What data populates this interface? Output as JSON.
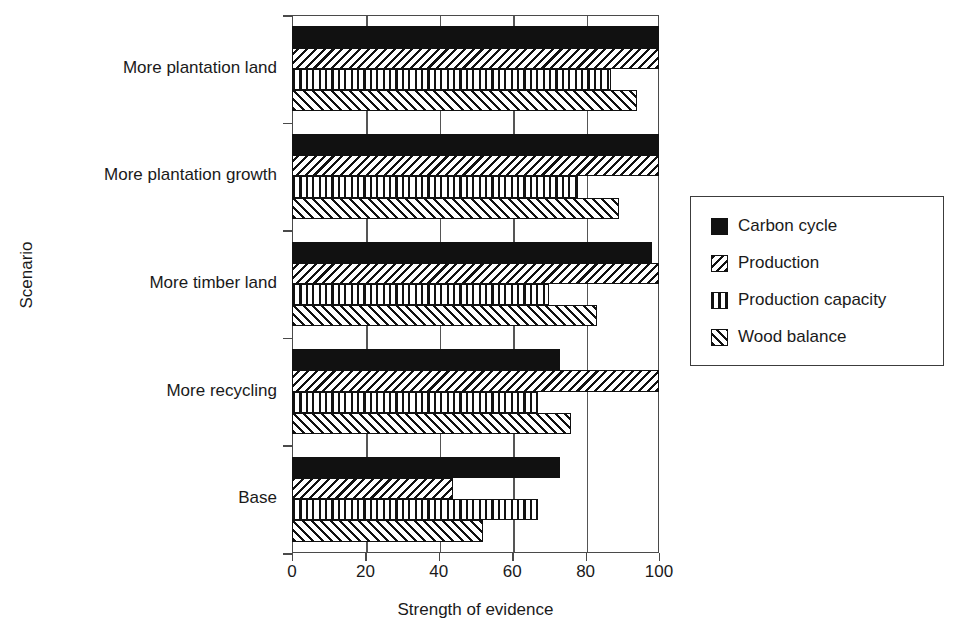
{
  "chart_data": {
    "type": "bar",
    "orientation": "horizontal",
    "title": "",
    "xlabel": "Strength of evidence",
    "ylabel": "Scenario",
    "xlim": [
      0,
      100
    ],
    "ylim": null,
    "grid": "vertical",
    "xticks": [
      0,
      20,
      40,
      60,
      80,
      100
    ],
    "xticklabels": [
      "0",
      "20",
      "40",
      "60",
      "80",
      "100"
    ],
    "categories": [
      "More plantation land",
      "More plantation growth",
      "More timber land",
      "More recycling",
      "Base"
    ],
    "legend_position": "right",
    "series": [
      {
        "name": "Carbon cycle",
        "pattern": "solid-black",
        "color": "#111111",
        "values": [
          100,
          100,
          98,
          73,
          73
        ]
      },
      {
        "name": "Production",
        "pattern": "backward-diagonal-hatch",
        "color": "#111111",
        "values": [
          100,
          100,
          100,
          100,
          44
        ]
      },
      {
        "name": "Production capacity",
        "pattern": "vertical-lines",
        "color": "#111111",
        "values": [
          87,
          78,
          70,
          67,
          67
        ]
      },
      {
        "name": "Wood balance",
        "pattern": "forward-diagonal-hatch",
        "color": "#111111",
        "values": [
          94,
          89,
          83,
          76,
          52
        ]
      }
    ]
  }
}
